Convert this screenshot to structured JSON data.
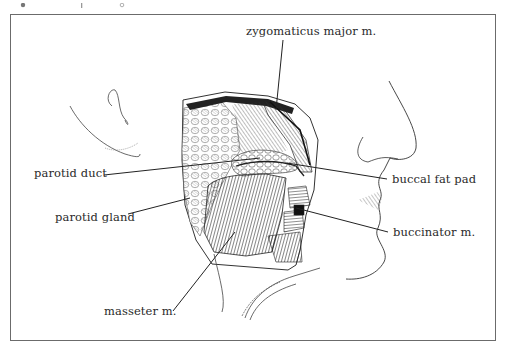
{
  "figure": {
    "labels": [
      {
        "id": "zygomaticus",
        "text": "zygomaticus major m.",
        "x": 246,
        "y": 26
      },
      {
        "id": "parotid_duct",
        "text": "parotid duct",
        "x": 34,
        "y": 173
      },
      {
        "id": "buccal_fat_pad",
        "text": "buccal fat pad",
        "x": 392,
        "y": 175
      },
      {
        "id": "parotid_gland",
        "text": "parotid gland",
        "x": 55,
        "y": 213
      },
      {
        "id": "buccinator",
        "text": "buccinator m.",
        "x": 393,
        "y": 229
      },
      {
        "id": "masseter",
        "text": "masseter m.",
        "x": 104,
        "y": 306
      }
    ],
    "colors": {
      "frame": "#6b6b6b",
      "ink": "#2a2a2a",
      "background": "#ffffff"
    }
  }
}
